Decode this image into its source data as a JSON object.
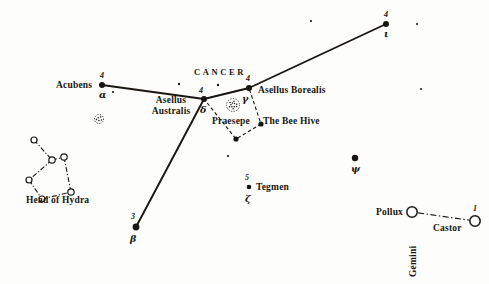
{
  "figure": {
    "title": "CANCER",
    "kind": "star-chart",
    "colors": {
      "ink": "#181510",
      "paper": "#fdfdfb",
      "line": "#1a1712"
    }
  },
  "chart_data": {
    "type": "scatter",
    "title": "CANCER",
    "subtitle": "",
    "xlabel": "",
    "ylabel": "",
    "xlim": [
      0,
      489
    ],
    "ylim": [
      0,
      284
    ],
    "grid": false,
    "legend": "none",
    "projection": "celestial star chart (antique engraving)",
    "constellations": [
      {
        "name": "Cancer",
        "label": "CANCER",
        "label_xy": [
          194,
          72
        ]
      },
      {
        "name": "Gemini",
        "label": "Gemini",
        "label_xy": [
          409,
          272
        ],
        "rotated": true
      },
      {
        "name": "Hydra",
        "label": "Head of Hydra",
        "label_xy": [
          67,
          203
        ]
      }
    ],
    "stars": [
      {
        "id": "acubens",
        "name": "Acubens",
        "magnitude": "4",
        "greek": "α",
        "x": 102,
        "y": 85,
        "r": 3.0,
        "style": "filled",
        "label_pos": "left",
        "label_xy": [
          56,
          88
        ],
        "mag_xy": [
          100,
          76
        ],
        "greek_xy": [
          99,
          95
        ]
      },
      {
        "id": "asellus-australis",
        "name": "Asellus Australis",
        "magnitude": "4",
        "greek": "δ",
        "x": 204,
        "y": 99,
        "r": 3.0,
        "style": "filled",
        "label_pos": "left-two-line",
        "label_line1": "Asellus",
        "label_line2": "Australis",
        "label_xy": [
          152,
          100
        ],
        "mag_xy": [
          198,
          90
        ],
        "greek_xy": [
          200,
          110
        ]
      },
      {
        "id": "asellus-borealis",
        "name": "Asellus Borealis",
        "magnitude": "4",
        "greek": "γ",
        "x": 249,
        "y": 88,
        "r": 3.0,
        "style": "filled",
        "label_pos": "right",
        "label_xy": [
          258,
          92
        ],
        "mag_xy": [
          246,
          78
        ],
        "greek_xy": [
          243,
          99
        ]
      },
      {
        "id": "iota-cancri",
        "name": "",
        "magnitude": "4",
        "greek": "ι",
        "x": 386,
        "y": 24,
        "r": 3.0,
        "style": "filled",
        "label_pos": "none",
        "label_xy": [
          0,
          0
        ],
        "mag_xy": [
          384,
          14
        ],
        "greek_xy": [
          384,
          33
        ]
      },
      {
        "id": "beta-cancri",
        "name": "",
        "magnitude": "3",
        "greek": "β",
        "x": 136,
        "y": 227,
        "r": 3.4,
        "style": "filled",
        "label_pos": "none",
        "label_xy": [
          0,
          0
        ],
        "mag_xy": [
          131,
          216
        ],
        "greek_xy": [
          131,
          239
        ]
      },
      {
        "id": "tegmen",
        "name": "Tegmen",
        "magnitude": "5",
        "greek": "ζ",
        "x": 249,
        "y": 187,
        "r": 2.3,
        "style": "filled",
        "label_pos": "right",
        "label_xy": [
          256,
          190
        ],
        "mag_xy": [
          245,
          177
        ],
        "greek_xy": [
          245,
          200
        ]
      },
      {
        "id": "psi-cancri",
        "name": "",
        "magnitude": "",
        "greek": "ψ",
        "x": 355,
        "y": 158,
        "r": 3.2,
        "style": "filled",
        "label_pos": "none",
        "label_xy": [
          0,
          0
        ],
        "mag_xy": [
          0,
          0
        ],
        "greek_xy": [
          352,
          169
        ]
      },
      {
        "id": "pollux",
        "name": "Pollux",
        "magnitude": "",
        "greek": "",
        "x": 412,
        "y": 212,
        "r": 5.2,
        "style": "open",
        "label_pos": "left",
        "label_xy": [
          376,
          214
        ],
        "mag_xy": [
          0,
          0
        ],
        "greek_xy": [
          0,
          0
        ]
      },
      {
        "id": "castor",
        "name": "Castor",
        "magnitude": "1",
        "greek": "",
        "x": 475,
        "y": 221,
        "r": 5.2,
        "style": "open",
        "label_pos": "below-left",
        "label_xy": [
          433,
          229
        ],
        "mag_xy": [
          473,
          208
        ],
        "greek_xy": [
          0,
          0
        ]
      }
    ],
    "faint_stars": [
      {
        "x": 113,
        "y": 92,
        "r": 1.1
      },
      {
        "x": 179,
        "y": 84,
        "r": 1.2
      },
      {
        "x": 218,
        "y": 85,
        "r": 1.2
      },
      {
        "x": 228,
        "y": 156,
        "r": 1.1
      },
      {
        "x": 311,
        "y": 21,
        "r": 1.1
      },
      {
        "x": 417,
        "y": 24,
        "r": 1.0
      },
      {
        "x": 421,
        "y": 89,
        "r": 1.0
      }
    ],
    "cluster_symbols": [
      {
        "id": "praesepe-symbol",
        "name": "Praesepe",
        "x": 233,
        "y": 105,
        "r": 6.5,
        "style": "stippled-circle"
      },
      {
        "id": "unnamed-cluster",
        "name": "",
        "x": 99,
        "y": 119,
        "r": 4.5,
        "style": "dotted-circle"
      }
    ],
    "hydra_stars": [
      {
        "x": 34,
        "y": 140,
        "r": 3.0
      },
      {
        "x": 52,
        "y": 160,
        "r": 3.2
      },
      {
        "x": 64,
        "y": 157,
        "r": 3.2
      },
      {
        "x": 29,
        "y": 180,
        "r": 3.0
      },
      {
        "x": 42,
        "y": 199,
        "r": 3.0
      },
      {
        "x": 71,
        "y": 192,
        "r": 3.2
      }
    ],
    "hydra_links": [
      [
        0,
        1
      ],
      [
        1,
        2
      ],
      [
        1,
        3
      ],
      [
        3,
        4
      ],
      [
        4,
        5
      ],
      [
        5,
        2
      ]
    ],
    "solid_lines": [
      {
        "from": "acubens",
        "to": "asellus-australis"
      },
      {
        "from": "asellus-australis",
        "to": "asellus-borealis"
      },
      {
        "from": "asellus-borealis",
        "to": "iota-cancri"
      },
      {
        "from": "asellus-australis",
        "to": "beta-cancri"
      }
    ],
    "praesepe_polygon": {
      "id": "praesepe-quadrilateral",
      "style": "dashed",
      "points": [
        [
          204,
          99
        ],
        [
          249,
          88
        ],
        [
          261,
          124
        ],
        [
          236,
          139
        ]
      ]
    },
    "gemini_link": {
      "style": "dash-dot",
      "from": "pollux",
      "to": "castor"
    },
    "annotations": [
      {
        "id": "praesepe-label",
        "text": "Praesepe",
        "x": 212,
        "y": 121
      },
      {
        "id": "bee-hive-label",
        "text": "The Bee Hive",
        "x": 263,
        "y": 121
      },
      {
        "id": "head-of-hydra-label",
        "text": "Head of Hydra",
        "x": 26,
        "y": 200
      },
      {
        "id": "gemini-label",
        "text": "Gemini",
        "x": 409,
        "y": 277
      }
    ]
  }
}
